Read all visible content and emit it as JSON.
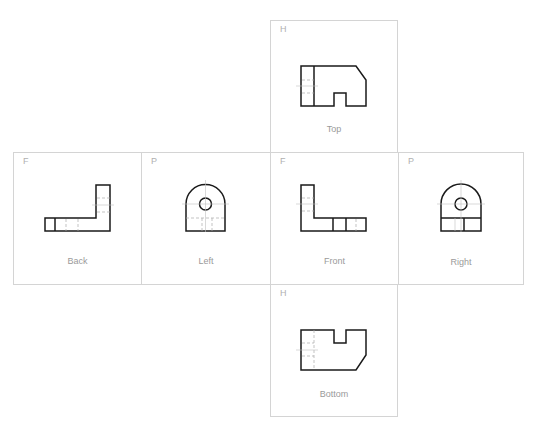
{
  "views": [
    {
      "id": "top",
      "label": "Top",
      "plane": "H",
      "box": [
        270,
        20,
        128,
        132
      ]
    },
    {
      "id": "back",
      "label": "Back",
      "plane": "F",
      "box": [
        13,
        152,
        128,
        132
      ]
    },
    {
      "id": "left",
      "label": "Left",
      "plane": "P",
      "box": [
        141,
        152,
        129,
        132
      ]
    },
    {
      "id": "front",
      "label": "Front",
      "plane": "F",
      "box": [
        270,
        152,
        128,
        132
      ]
    },
    {
      "id": "right",
      "label": "Right",
      "plane": "P",
      "box": [
        398,
        152,
        126,
        132
      ]
    },
    {
      "id": "bottom",
      "label": "Bottom",
      "plane": "H",
      "box": [
        270,
        284,
        128,
        132
      ]
    }
  ],
  "colors": {
    "border": "#d4d4d4",
    "line": "#1a1a1a",
    "hidden": "#aaaaaa",
    "label": "#9a9a9a"
  }
}
